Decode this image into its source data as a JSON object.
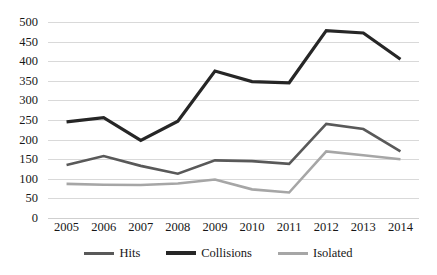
{
  "chart_data": {
    "type": "line",
    "title": "",
    "subtitle": "",
    "xlabel": "",
    "ylabel": "",
    "categories": [
      "2005",
      "2006",
      "2007",
      "2008",
      "2009",
      "2010",
      "2011",
      "2012",
      "2013",
      "2014"
    ],
    "x": [
      2005,
      2006,
      2007,
      2008,
      2009,
      2010,
      2011,
      2012,
      2013,
      2014
    ],
    "ylim": [
      0,
      500
    ],
    "ytick_step": 50,
    "yticks": [
      500,
      450,
      400,
      350,
      300,
      250,
      200,
      150,
      100,
      50,
      0
    ],
    "ytick_labels": [
      "500",
      "450",
      "400",
      "350",
      "300",
      "250",
      "200",
      "150",
      "100",
      "50",
      "0"
    ],
    "grid": "horizontal",
    "legend_position": "bottom-center",
    "series": [
      {
        "name": "Hits",
        "color": "#595959",
        "line_width": 2.6,
        "values": [
          135,
          158,
          133,
          113,
          147,
          145,
          138,
          240,
          227,
          170
        ]
      },
      {
        "name": "Collisions",
        "color": "#262626",
        "line_width": 3.2,
        "values": [
          245,
          256,
          198,
          247,
          375,
          348,
          345,
          478,
          472,
          405
        ]
      },
      {
        "name": "Isolated",
        "color": "#a6a6a6",
        "line_width": 2.6,
        "values": [
          87,
          85,
          84,
          88,
          98,
          73,
          65,
          170,
          160,
          150
        ]
      }
    ]
  },
  "legend": {
    "items": [
      {
        "label": "Hits",
        "color": "#595959",
        "thickness": "3px"
      },
      {
        "label": "Collisions",
        "color": "#262626",
        "thickness": "4px"
      },
      {
        "label": "Isolated",
        "color": "#a6a6a6",
        "thickness": "3px"
      }
    ]
  },
  "style": {
    "background": "#ffffff",
    "gridline_color": "#d9d9d9",
    "text_color": "#171717"
  }
}
